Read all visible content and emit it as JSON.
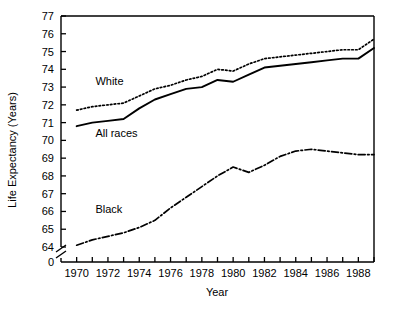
{
  "chart_data": {
    "type": "line",
    "title": "",
    "xlabel": "Year",
    "ylabel": "Life Expectancy (Years)",
    "xlim": [
      1969,
      1989
    ],
    "ylim": [
      63.5,
      77
    ],
    "grid": false,
    "legend_position": "inline-annotations",
    "axis_break": {
      "axis": "y",
      "between": [
        0,
        64
      ],
      "zero_label": "0"
    },
    "x": [
      1970,
      1971,
      1972,
      1973,
      1974,
      1975,
      1976,
      1977,
      1978,
      1979,
      1980,
      1981,
      1982,
      1983,
      1984,
      1985,
      1986,
      1987,
      1988,
      1989
    ],
    "xticks": [
      1970,
      1971,
      1972,
      1973,
      1974,
      1975,
      1976,
      1977,
      1978,
      1979,
      1980,
      1981,
      1982,
      1983,
      1984,
      1985,
      1986,
      1987,
      1988,
      1989
    ],
    "xtick_labels": [
      "1970",
      "",
      "1972",
      "",
      "1974",
      "",
      "1976",
      "",
      "1978",
      "",
      "1980",
      "",
      "1982",
      "",
      "1984",
      "",
      "1986",
      "",
      "1988",
      ""
    ],
    "yticks": [
      64,
      65,
      66,
      67,
      68,
      69,
      70,
      71,
      72,
      73,
      74,
      75,
      76,
      77
    ],
    "ytick_labels": [
      "64",
      "65",
      "66",
      "67",
      "68",
      "69",
      "70",
      "71",
      "72",
      "73",
      "74",
      "75",
      "76",
      "77"
    ],
    "series": [
      {
        "name": "White",
        "style": "dotted",
        "color": "#000000",
        "label_x": 1971.2,
        "label_y": 73.1,
        "values": [
          71.7,
          71.9,
          72.0,
          72.1,
          72.5,
          72.9,
          73.1,
          73.4,
          73.6,
          74.0,
          73.9,
          74.3,
          74.6,
          74.7,
          74.8,
          74.9,
          75.0,
          75.1,
          75.1,
          75.7
        ]
      },
      {
        "name": "All races",
        "style": "solid",
        "color": "#000000",
        "label_x": 1971.2,
        "label_y": 70.2,
        "values": [
          70.8,
          71.0,
          71.1,
          71.2,
          71.8,
          72.3,
          72.6,
          72.9,
          73.0,
          73.4,
          73.3,
          73.7,
          74.1,
          74.2,
          74.3,
          74.4,
          74.5,
          74.6,
          74.6,
          75.2
        ]
      },
      {
        "name": "Black",
        "style": "dashdot",
        "color": "#000000",
        "label_x": 1971.2,
        "label_y": 65.9,
        "values": [
          64.1,
          64.4,
          64.6,
          64.8,
          65.1,
          65.5,
          66.2,
          66.8,
          67.4,
          68.0,
          68.5,
          68.2,
          68.6,
          69.1,
          69.4,
          69.5,
          69.4,
          69.3,
          69.2,
          69.2
        ]
      }
    ]
  }
}
